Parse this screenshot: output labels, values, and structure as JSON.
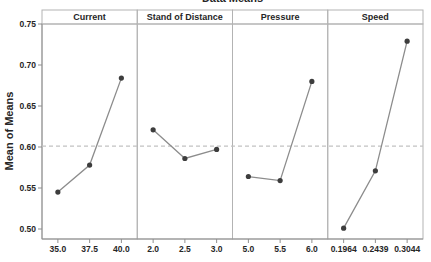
{
  "chart_data": {
    "type": "line",
    "title": "Data Means",
    "ylabel": "Mean of Means",
    "xlabel": "",
    "y_ticks": [
      0.5,
      0.55,
      0.6,
      0.65,
      0.7,
      0.75
    ],
    "ylim": [
      0.489,
      0.75
    ],
    "grid": "off",
    "legend": "none",
    "reference_line": 0.601,
    "reference_line_style": "dashed",
    "panels": [
      {
        "label": "Current",
        "x_ticks": [
          "35.0",
          "37.5",
          "40.0"
        ],
        "values": [
          0.545,
          0.578,
          0.684
        ]
      },
      {
        "label": "Stand of Distance",
        "x_ticks": [
          "2.0",
          "2.5",
          "3.0"
        ],
        "values": [
          0.621,
          0.586,
          0.597
        ]
      },
      {
        "label": "Pressure",
        "x_ticks": [
          "5.0",
          "5.5",
          "6.0"
        ],
        "values": [
          0.564,
          0.559,
          0.68
        ]
      },
      {
        "label": "Speed",
        "x_ticks": [
          "0.1964",
          "0.2439",
          "0.3044"
        ],
        "values": [
          0.501,
          0.571,
          0.729
        ]
      }
    ],
    "colors": {
      "series_line": "#8c8c8c",
      "marker": "#3d3d3d",
      "reference_line": "#c2c2c2",
      "axis": "#8f8f8f",
      "panel_border": "#b3b3b3",
      "text": "#262626",
      "background": "#ffffff"
    }
  }
}
